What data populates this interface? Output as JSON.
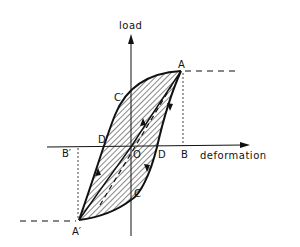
{
  "diagram": {
    "type": "hysteresis-loop",
    "axes": {
      "x_label": "deformation",
      "y_label": "load"
    },
    "points": {
      "A": "A",
      "A_prime": "A′",
      "B": "B",
      "B_prime": "B′",
      "C": "C",
      "C_prime": "C′",
      "D": "D",
      "D_prime": "D′",
      "O": "O"
    },
    "colors": {
      "ink": "#111111",
      "background": "#ffffff"
    }
  }
}
